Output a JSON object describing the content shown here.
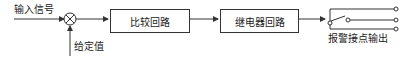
{
  "diagram": {
    "input_label": "输入信号",
    "setpoint_label": "给定值",
    "blocks": [
      {
        "id": "compare",
        "label": "比较回路"
      },
      {
        "id": "relay",
        "label": "继电器回路"
      }
    ],
    "output_label": "报警接点输出",
    "summing_junction_icon": "circle-cross",
    "line_color": "#333333",
    "text_color": "#222222"
  }
}
